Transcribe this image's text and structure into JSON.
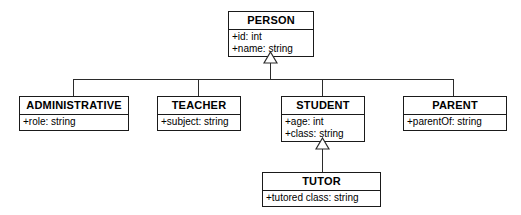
{
  "diagram": {
    "type": "uml-class-diagram",
    "title": "",
    "notation": {
      "generalization_marker": "hollow-triangle",
      "visibility_public": "+"
    },
    "classes": [
      {
        "id": "person",
        "name": "PERSON",
        "attributes": [
          "+id: int",
          "+name: string"
        ],
        "x": 228,
        "y": 11,
        "w": 86,
        "h": 41
      },
      {
        "id": "administrative",
        "name": "ADMINISTRATIVE",
        "attributes": [
          "+role: string"
        ],
        "x": 19,
        "y": 96,
        "w": 110,
        "h": 30
      },
      {
        "id": "teacher",
        "name": "TEACHER",
        "attributes": [
          "+subject: string"
        ],
        "x": 157,
        "y": 96,
        "w": 84,
        "h": 30
      },
      {
        "id": "student",
        "name": "STUDENT",
        "attributes": [
          "+age: int",
          "+class: string"
        ],
        "x": 281,
        "y": 96,
        "w": 84,
        "h": 41
      },
      {
        "id": "parent",
        "name": "PARENT",
        "attributes": [
          "+parentOf: string"
        ],
        "x": 403,
        "y": 96,
        "w": 104,
        "h": 30
      },
      {
        "id": "tutor",
        "name": "TUTOR",
        "attributes": [
          "+tutored class: string"
        ],
        "x": 262,
        "y": 172,
        "w": 119,
        "h": 30
      }
    ],
    "generalizations": [
      {
        "from": "administrative",
        "to": "person"
      },
      {
        "from": "teacher",
        "to": "person"
      },
      {
        "from": "student",
        "to": "person"
      },
      {
        "from": "parent",
        "to": "person"
      },
      {
        "from": "tutor",
        "to": "student"
      }
    ],
    "colors": {
      "line": "#2b2b2b",
      "box_border": "#1a1a1a",
      "box_fill": "#ffffff",
      "text": "#000000",
      "background": "#ffffff"
    }
  }
}
